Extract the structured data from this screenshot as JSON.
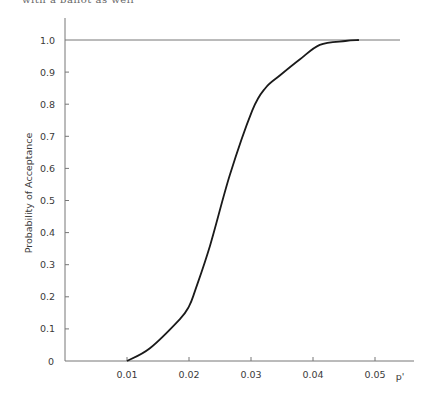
{
  "header": {
    "clipped_text": "with a ballot as well"
  },
  "chart_data": {
    "type": "line",
    "title": "",
    "xlabel": "p'",
    "ylabel": "Probability of Acceptance",
    "xlim": [
      0,
      0.055
    ],
    "ylim": [
      0,
      1.0
    ],
    "grid": false,
    "legend": null,
    "x_ticks": [
      "0.01",
      "0.02",
      "0.03",
      "0.04",
      "0.05"
    ],
    "x_tick_values": [
      0.01,
      0.02,
      0.03,
      0.04,
      0.05
    ],
    "y_ticks": [
      "0",
      "0.1",
      "0.2",
      "0.3",
      "0.4",
      "0.5",
      "0.6",
      "0.7",
      "0.8",
      "0.9",
      "1.0"
    ],
    "y_tick_values": [
      0,
      0.1,
      0.2,
      0.3,
      0.4,
      0.5,
      0.6,
      0.7,
      0.8,
      0.9,
      1.0
    ],
    "reference_line": {
      "y": 1.0,
      "label": "1.0"
    },
    "series": [
      {
        "name": "OC curve",
        "x": [
          0.01,
          0.0137,
          0.0185,
          0.02,
          0.021,
          0.0234,
          0.0266,
          0.0302,
          0.0323,
          0.0347,
          0.0379,
          0.0411,
          0.0452,
          0.0474
        ],
        "y": [
          0.0,
          0.04,
          0.13,
          0.17,
          0.22,
          0.36,
          0.58,
          0.78,
          0.85,
          0.89,
          0.94,
          0.985,
          0.997,
          1.0
        ]
      }
    ]
  }
}
